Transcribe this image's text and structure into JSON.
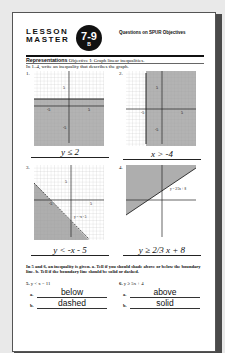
{
  "header": {
    "lesson_line1": "LESSON",
    "lesson_line2": "MASTER",
    "badge_number": "7-9",
    "badge_level": "B",
    "spur_title": "Questions on SPUR Objectives"
  },
  "objective": {
    "category": "Representations",
    "text": "Objective I: Graph linear inequalities."
  },
  "part1": {
    "instructions": "In 1–4, write an inequality that describes the graph.",
    "questions": [
      {
        "number": "1.",
        "answer": "y ≤ 2",
        "axis_labels": {
          "pos_y": "5",
          "neg_y": "-5",
          "neg_x": "-5",
          "pos_x": "5",
          "x": "x",
          "y": "y"
        }
      },
      {
        "number": "2.",
        "answer": "x > -4",
        "axis_labels": {
          "pos_y": "5",
          "neg_y": "-5",
          "neg_x": "-5",
          "pos_x": "5",
          "x": "x",
          "y": "y"
        }
      },
      {
        "number": "3.",
        "answer": "y < -x - 5",
        "line_label": "y = -x - 5",
        "axis_labels": {
          "pos_y": "5",
          "neg_x": "-5",
          "pos_x": "5",
          "x": "x",
          "y": "y"
        }
      },
      {
        "number": "4.",
        "answer": "y ≥ 2/3 x + 8",
        "line_label": "y = 2/3 x + 8",
        "axis_labels": {
          "x": "x",
          "y": "y"
        }
      }
    ]
  },
  "part2": {
    "instructions": "In 5 and 6, an inequality is given. a. Tell if you should shade above or below the boundary line. b. Tell if the boundary line should be solid or dashed.",
    "questions": [
      {
        "number": "5.",
        "inequality": "y < x − 11",
        "a_label": "a.",
        "a_answer": "below",
        "b_label": "b.",
        "b_answer": "dashed"
      },
      {
        "number": "6.",
        "inequality": "y ≥ 5x + 4",
        "a_label": "a.",
        "a_answer": "above",
        "b_label": "b.",
        "b_answer": "solid"
      }
    ]
  }
}
